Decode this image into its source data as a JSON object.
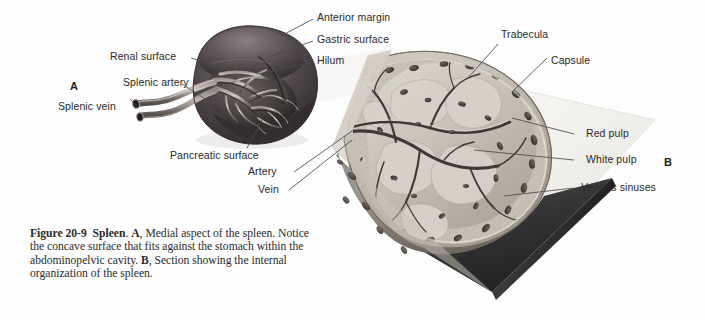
{
  "figure": {
    "number": "Figure 20-9",
    "organ": "Spleen",
    "panel_a_letter": "A",
    "panel_b_letter": "B",
    "caption_segments": {
      "fig_label": "Figure 20-9",
      "organ_bold": "Spleen",
      "a_bold": "A",
      "a_text": ", Medial aspect of the spleen. Notice the concave surface that fits against the stomach within the abdominopelvic cavity. ",
      "b_bold": "B",
      "b_text": ", Section showing the internal organization of the spleen.",
      "organ_after": ". "
    },
    "caption_plain": "Figure 20-9  Spleen. A, Medial aspect of the spleen. Notice the concave surface that fits against the stomach within the abdominopelvic cavity. B, Section showing the internal organization of the spleen."
  },
  "panel_a": {
    "letter": "A",
    "labels": {
      "renal_surface": "Renal surface",
      "splenic_artery": "Splenic artery",
      "splenic_vein": "Splenic vein",
      "anterior_margin": "Anterior margin",
      "gastric_surface": "Gastric surface",
      "hilum": "Hilum",
      "pancreatic_surface": "Pancreatic surface"
    }
  },
  "panel_b": {
    "letter": "B",
    "labels": {
      "trabecula": "Trabecula",
      "capsule": "Capsule",
      "artery": "Artery",
      "vein": "Vein",
      "red_pulp": "Red pulp",
      "white_pulp": "White pulp",
      "venous_sinuses": "Venous sinuses"
    }
  },
  "colors": {
    "background": "#fdfdfd",
    "label_text": "#2a2a2a",
    "caption_text": "#2b2b2b",
    "leader_line": "#4a4a4a",
    "spleen_dark": "#3a3436",
    "spleen_mid": "#554c4e",
    "spleen_light": "#756a6c",
    "vessel_light": "#b9b2ac",
    "vessel_dark": "#5d5753",
    "section_pulp": "#b9b1a7",
    "section_pulp_light": "#d2cbc1",
    "capsule": "#8d857b",
    "plane_light": "#f2f1ee",
    "shadow_dark": "#2f2f31"
  }
}
